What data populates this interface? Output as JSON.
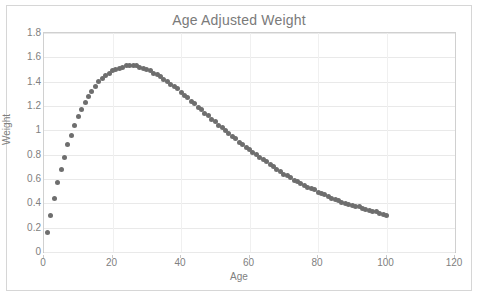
{
  "chart_data": {
    "type": "scatter",
    "title": "Age Adjusted Weight",
    "xlabel": "Age",
    "ylabel": "Weight",
    "xlim": [
      0,
      120
    ],
    "ylim": [
      0,
      1.8
    ],
    "xticks": [
      "0",
      "20",
      "40",
      "60",
      "80",
      "100",
      "120"
    ],
    "yticks": [
      "0",
      "0.2",
      "0.4",
      "0.6",
      "0.8",
      "1",
      "1.2",
      "1.4",
      "1.6",
      "1.8"
    ],
    "xtick_values": [
      0,
      20,
      40,
      60,
      80,
      100,
      120
    ],
    "ytick_values": [
      0,
      0.2,
      0.4,
      0.6,
      0.8,
      1,
      1.2,
      1.4,
      1.6,
      1.8
    ],
    "grid": true,
    "grid_axes": "both",
    "legend": "none",
    "marker_color": "#6e6e6e",
    "series": [
      {
        "name": "Age Adjusted Weight",
        "x": [
          1,
          2,
          3,
          4,
          5,
          6,
          7,
          8,
          9,
          10,
          11,
          12,
          13,
          14,
          15,
          16,
          17,
          18,
          19,
          20,
          21,
          22,
          23,
          24,
          25,
          26,
          27,
          28,
          29,
          30,
          31,
          32,
          33,
          34,
          35,
          36,
          37,
          38,
          39,
          40,
          41,
          42,
          43,
          44,
          45,
          46,
          47,
          48,
          49,
          50,
          51,
          52,
          53,
          54,
          55,
          56,
          57,
          58,
          59,
          60,
          61,
          62,
          63,
          64,
          65,
          66,
          67,
          68,
          69,
          70,
          71,
          72,
          73,
          74,
          75,
          76,
          77,
          78,
          79,
          80,
          81,
          82,
          83,
          84,
          85,
          86,
          87,
          88,
          89,
          90,
          91,
          92,
          93,
          94,
          95,
          96,
          97,
          98,
          99,
          100
        ],
        "y": [
          0.16,
          0.3,
          0.44,
          0.57,
          0.68,
          0.78,
          0.88,
          0.96,
          1.04,
          1.11,
          1.17,
          1.23,
          1.28,
          1.32,
          1.36,
          1.4,
          1.43,
          1.45,
          1.47,
          1.49,
          1.5,
          1.51,
          1.52,
          1.53,
          1.53,
          1.53,
          1.53,
          1.52,
          1.51,
          1.5,
          1.49,
          1.47,
          1.46,
          1.44,
          1.42,
          1.4,
          1.38,
          1.36,
          1.34,
          1.31,
          1.29,
          1.27,
          1.24,
          1.22,
          1.19,
          1.17,
          1.14,
          1.12,
          1.09,
          1.07,
          1.04,
          1.02,
          1.0,
          0.97,
          0.95,
          0.93,
          0.9,
          0.88,
          0.86,
          0.84,
          0.82,
          0.8,
          0.78,
          0.76,
          0.74,
          0.72,
          0.7,
          0.68,
          0.66,
          0.64,
          0.63,
          0.61,
          0.59,
          0.58,
          0.56,
          0.55,
          0.53,
          0.52,
          0.51,
          0.49,
          0.48,
          0.47,
          0.46,
          0.44,
          0.43,
          0.42,
          0.41,
          0.4,
          0.39,
          0.38,
          0.37,
          0.37,
          0.36,
          0.35,
          0.34,
          0.33,
          0.33,
          0.32,
          0.31,
          0.3
        ]
      }
    ],
    "annotations": {
      "peak_age": 25,
      "peak_value": 1.53,
      "start_age": 1,
      "start_value": 0.16,
      "end_age": 100,
      "end_value": 0.3
    }
  }
}
